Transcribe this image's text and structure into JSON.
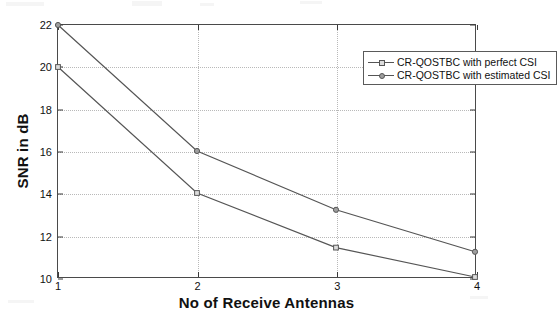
{
  "chart_data": {
    "type": "line",
    "title": "",
    "xlabel": "No of Receive Antennas",
    "ylabel": "SNR in dB",
    "x": [
      1,
      2,
      3,
      4
    ],
    "xticklabels": [
      "1",
      "2",
      "3",
      "4"
    ],
    "yticklabels": [
      "10",
      "12",
      "14",
      "16",
      "18",
      "20",
      "22"
    ],
    "yticks": [
      10,
      12,
      14,
      16,
      18,
      20,
      22
    ],
    "xlim": [
      1,
      4
    ],
    "ylim": [
      10,
      22
    ],
    "grid": true,
    "legend_position": "top-right",
    "series": [
      {
        "name": "CR-QOSTBC with perfect CSI",
        "marker": "square",
        "values": [
          20,
          14,
          11.4,
          10
        ]
      },
      {
        "name": "CR-QOSTBC with estimated CSI",
        "marker": "circle",
        "values": [
          22,
          16,
          13.2,
          11.2
        ]
      }
    ]
  },
  "axes": {
    "ylabel": "SNR in dB",
    "xlabel": "No of Receive Antennas"
  },
  "legend": {
    "entries": [
      {
        "label": "CR-QOSTBC with perfect CSI",
        "marker": "square"
      },
      {
        "label": "CR-QOSTBC with estimated CSI",
        "marker": "circle"
      }
    ]
  },
  "colors": {
    "line": "#555555",
    "axis": "#4a4a4a",
    "grid": "#b9b9b9",
    "text": "#111111",
    "background": "#ffffff"
  }
}
